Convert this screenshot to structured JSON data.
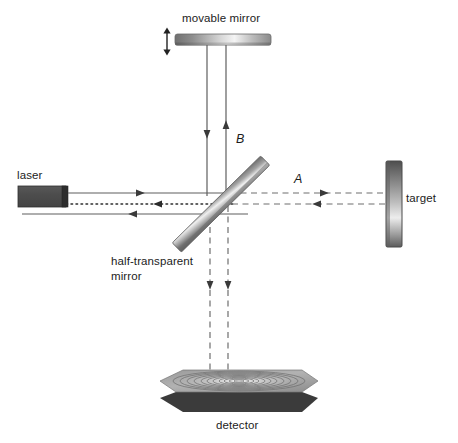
{
  "figure": {
    "type": "optical-interferometer-diagram",
    "background_color": "#ffffff",
    "width": 458,
    "height": 443
  },
  "labels": {
    "movable_mirror": "movable mirror",
    "laser": "laser",
    "target": "target",
    "detector": "detector",
    "half_transparent_mirror": "half-transparent\nmirror",
    "beam_a": "A",
    "beam_b": "B"
  },
  "components": {
    "movable_mirror": {
      "name": "movable mirror",
      "shape": "horizontal-bar",
      "gradient": "dark-light-dark",
      "colors": [
        "#6e6e6e",
        "#f2f2f2",
        "#808080"
      ]
    },
    "laser": {
      "name": "laser",
      "shape": "rectangle",
      "color": "#4f4f4f",
      "edge_color": "#2b2b2b"
    },
    "beam_splitter": {
      "name": "half-transparent mirror",
      "shape": "tilted-bar",
      "angle_deg": -45,
      "gradient": "dark-light-dark",
      "colors": [
        "#5a5a5a",
        "#ededed",
        "#7d7d7d"
      ]
    },
    "target": {
      "name": "target",
      "shape": "vertical-bar",
      "gradient": "dark-light-dark",
      "colors": [
        "#555555",
        "#f0f0f0",
        "#6a6a6a"
      ]
    },
    "detector": {
      "name": "detector",
      "shape": "perspective-plate",
      "surface_color": "#a8a8a8",
      "edge_color": "#3c3c3c",
      "fringe_pattern": "concentric-ellipses",
      "fringe_count": 11
    }
  },
  "beams": {
    "laser_out": {
      "style": "solid",
      "direction": "right",
      "color": "#5a5a5a"
    },
    "reference_return": {
      "style": "dotted",
      "direction": "left",
      "color": "#3a3a3a"
    },
    "measurement_return": {
      "style": "solid",
      "direction": "left",
      "color": "#5a5a5a"
    },
    "arm_b_down": {
      "style": "solid",
      "direction": "down",
      "color": "#5a5a5a"
    },
    "arm_b_up": {
      "style": "solid",
      "direction": "up",
      "color": "#5a5a5a"
    },
    "arm_a_out": {
      "style": "dashed",
      "direction": "right",
      "color": "#6a6a6a"
    },
    "arm_a_back": {
      "style": "dashed",
      "direction": "left",
      "color": "#6a6a6a"
    },
    "to_detector_left": {
      "style": "dashed",
      "direction": "down",
      "color": "#6a6a6a"
    },
    "to_detector_right": {
      "style": "dashed",
      "direction": "down",
      "color": "#6a6a6a"
    }
  },
  "annotations": {
    "movable_mirror_motion": {
      "name": "double-arrow",
      "direction": "vertical",
      "meaning": "mirror can translate up and down"
    }
  }
}
